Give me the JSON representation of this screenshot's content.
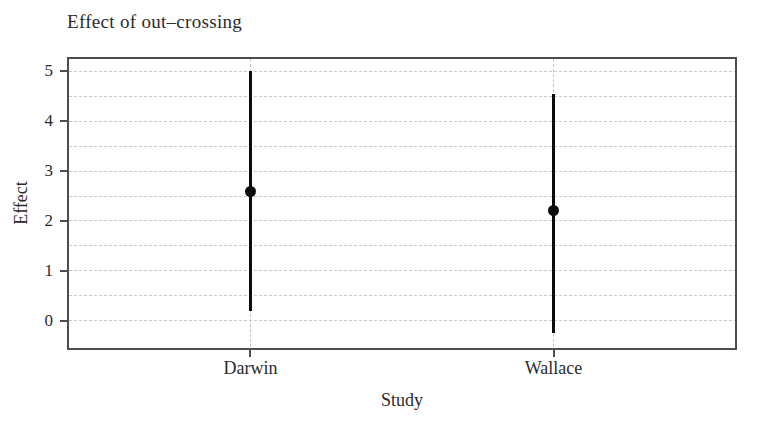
{
  "colors": {
    "background": "#ffffff",
    "frame": "#4d4d4d",
    "gridline": "#c9c9c9",
    "text": "#2b2b2b",
    "data": "#0d0d0d"
  },
  "chart_data": {
    "type": "scatter",
    "subtype": "point-estimates-with-error-bars",
    "title": "Effect of out–crossing",
    "xlabel": "Study",
    "ylabel": "Effect",
    "categories": [
      "Darwin",
      "Wallace"
    ],
    "series": [
      {
        "name": "effect-estimate",
        "points": [
          {
            "category": "Darwin",
            "estimate": 2.6,
            "lower": 0.2,
            "upper": 5.0
          },
          {
            "category": "Wallace",
            "estimate": 2.2,
            "lower": -0.25,
            "upper": 4.55
          }
        ]
      }
    ],
    "ylim": [
      -0.55,
      5.25
    ],
    "yticks": [
      0,
      1,
      2,
      3,
      4,
      5
    ],
    "grid": {
      "horizontal_every": 0.5,
      "horizontal_range": [
        0,
        5
      ],
      "vertical_at_categories": true
    },
    "legend": "none"
  }
}
